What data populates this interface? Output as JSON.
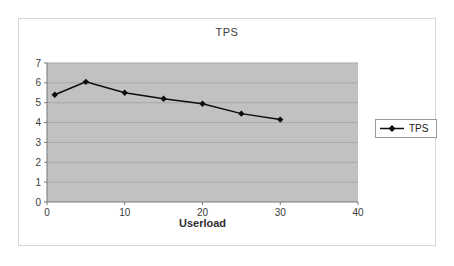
{
  "chart_data": {
    "type": "line",
    "title": "TPS",
    "xlabel": "Userload",
    "ylabel": "",
    "x": [
      1,
      5,
      10,
      15,
      20,
      25,
      30
    ],
    "series": [
      {
        "name": "TPS",
        "values": [
          5.4,
          6.05,
          5.5,
          5.2,
          4.95,
          4.45,
          4.15
        ]
      }
    ],
    "xlim": [
      0,
      40
    ],
    "ylim": [
      0,
      7
    ],
    "x_ticks": [
      0,
      10,
      20,
      30,
      40
    ],
    "y_ticks": [
      0,
      1,
      2,
      3,
      4,
      5,
      6,
      7
    ],
    "grid": "horizontal-only",
    "legend": {
      "position": "right",
      "items": [
        "TPS"
      ]
    },
    "colors": {
      "plot_background": "#c1c1c1",
      "gridline": "#a9a9a9",
      "axis": "#787878",
      "series_line": "#0d0d0d",
      "marker": "#0d0d0d",
      "frame_border": "#d7d7d7",
      "legend_border": "#9a9a9a",
      "text": "#3c3c3c"
    }
  }
}
